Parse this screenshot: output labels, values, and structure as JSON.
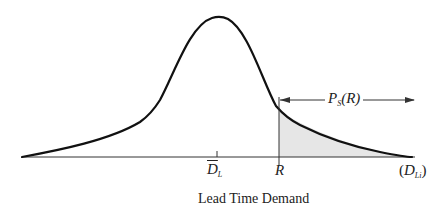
{
  "figure": {
    "type": "diagram",
    "curve_color": "#111111",
    "shade_color": "#e6e6e6",
    "baseline_color": "#333333"
  },
  "labels": {
    "mean": {
      "base": "D",
      "sub": "L",
      "overline": true
    },
    "reorder_point": "R",
    "variable": {
      "open": "(",
      "base": "D",
      "sub": "Li",
      "close": ")"
    },
    "stockout_prob": {
      "base": "P",
      "sub": "S",
      "arg": "(R)"
    },
    "axis_title": "Lead Time Demand"
  }
}
